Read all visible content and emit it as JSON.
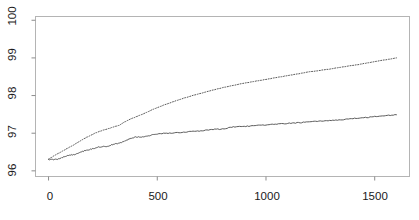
{
  "chart_data": {
    "type": "line",
    "title": "",
    "subtitle": "",
    "xlabel": "",
    "ylabel": "",
    "xlim": [
      -60,
      1660
    ],
    "ylim": [
      95.85,
      100.1
    ],
    "grid": false,
    "legend": "none",
    "xticks": [
      0,
      500,
      1000,
      1500
    ],
    "xtick_labels": [
      "0",
      "500",
      "1000",
      "1500"
    ],
    "yticks": [
      96,
      97,
      98,
      99,
      100
    ],
    "ytick_labels": [
      "96",
      "97",
      "98",
      "99",
      "100"
    ],
    "frame": true,
    "series": [
      {
        "name": "upper-dotted-series",
        "style": "dotted",
        "color": "#5a5a5a",
        "x": [
          0,
          25,
          50,
          75,
          100,
          125,
          150,
          175,
          200,
          225,
          250,
          275,
          300,
          325,
          350,
          375,
          400,
          425,
          450,
          475,
          500,
          550,
          600,
          650,
          700,
          750,
          800,
          850,
          900,
          950,
          1000,
          1050,
          1100,
          1150,
          1200,
          1250,
          1300,
          1350,
          1400,
          1450,
          1500,
          1550,
          1600
        ],
        "values": [
          96.31,
          96.4,
          96.48,
          96.56,
          96.64,
          96.72,
          96.81,
          96.89,
          96.96,
          97.03,
          97.08,
          97.12,
          97.17,
          97.21,
          97.3,
          97.37,
          97.43,
          97.49,
          97.55,
          97.62,
          97.68,
          97.79,
          97.89,
          97.98,
          98.06,
          98.14,
          98.21,
          98.27,
          98.33,
          98.38,
          98.43,
          98.48,
          98.53,
          98.58,
          98.63,
          98.67,
          98.71,
          98.76,
          98.8,
          98.85,
          98.9,
          98.95,
          99.0
        ]
      },
      {
        "name": "lower-solid-series",
        "style": "solid",
        "color": "#4a4a4a",
        "x": [
          0,
          25,
          50,
          75,
          100,
          125,
          150,
          175,
          200,
          225,
          250,
          275,
          300,
          325,
          350,
          375,
          400,
          425,
          450,
          475,
          500,
          550,
          600,
          650,
          700,
          750,
          800,
          850,
          900,
          950,
          1000,
          1050,
          1100,
          1150,
          1200,
          1250,
          1300,
          1350,
          1400,
          1450,
          1500,
          1550,
          1600
        ],
        "values": [
          96.3,
          96.3,
          96.32,
          96.38,
          96.42,
          96.44,
          96.5,
          96.55,
          96.58,
          96.63,
          96.64,
          96.66,
          96.71,
          96.73,
          96.79,
          96.86,
          96.9,
          96.9,
          96.92,
          96.95,
          96.98,
          97.0,
          97.02,
          97.04,
          97.06,
          97.1,
          97.11,
          97.17,
          97.18,
          97.2,
          97.22,
          97.24,
          97.26,
          97.28,
          97.3,
          97.32,
          97.34,
          97.36,
          97.39,
          97.41,
          97.44,
          97.47,
          97.49
        ]
      }
    ]
  },
  "axes": {
    "y_tick_100": "100",
    "y_tick_99": "99",
    "y_tick_98": "98",
    "y_tick_97": "97",
    "y_tick_96": "96",
    "x_tick_0": "0",
    "x_tick_500": "500",
    "x_tick_1000": "1000",
    "x_tick_1500": "1500"
  },
  "style": {
    "frame_color": "#b4b4b4",
    "tick_color": "#8c8c8c",
    "background": "#ffffff",
    "text_color": "#1a1a1a"
  }
}
